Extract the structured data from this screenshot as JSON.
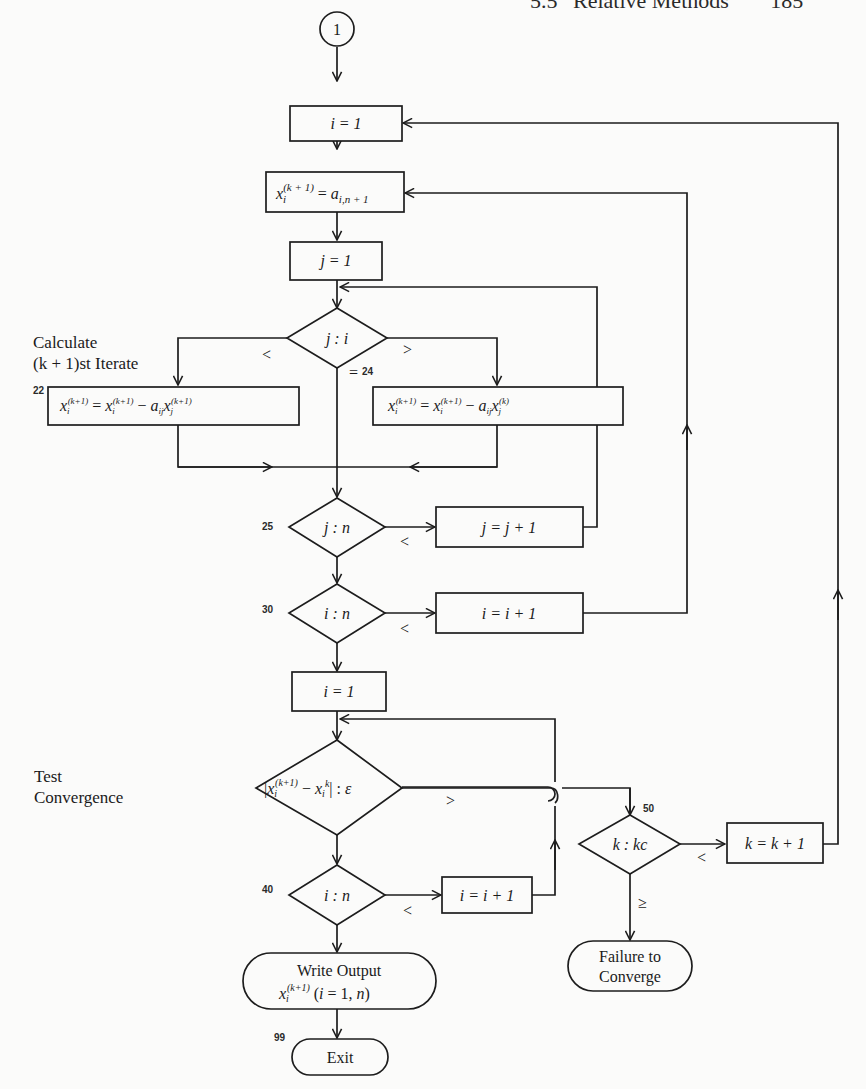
{
  "page_header": {
    "section": "5.5",
    "title": "Relative Methods",
    "page_number": "185"
  },
  "annotations": {
    "calculate_line1": "Calculate",
    "calculate_line2": "(k + 1)st Iterate",
    "test_line1": "Test",
    "test_line2": "Convergence"
  },
  "connector": {
    "label": "1"
  },
  "nodes": {
    "init_i": {
      "text": "i = 1"
    },
    "init_x": {
      "lhs": "x",
      "sub": "i",
      "sup": "(k + 1)",
      "eq": " = ",
      "rhs": "a",
      "rhs_sub": "i,n + 1"
    },
    "init_j": {
      "text": "j = 1"
    },
    "cmp_ji": {
      "text": "j : i"
    },
    "calc_lt": {
      "label": "22",
      "text": "x_i^(k+1) = x_i^(k+1) − a_ij x_j^(k+1)"
    },
    "calc_gt": {
      "label": "24",
      "text": "x_i^(k+1) = x_i^(k+1) − a_ij x_j^(k)"
    },
    "cmp_jn": {
      "label": "25",
      "text": "j : n"
    },
    "inc_j": {
      "text": "j = j + 1"
    },
    "cmp_in": {
      "label": "30",
      "text": "i : n"
    },
    "inc_i": {
      "text": "i = i + 1"
    },
    "reset_i": {
      "text": "i = 1"
    },
    "test_conv": {
      "text": "|x_i^(k+1) − x_i^k| : ε"
    },
    "cmp_in2": {
      "label": "40",
      "text": "i : n"
    },
    "inc_i2": {
      "text": "i = i + 1"
    },
    "cmp_kkc": {
      "label": "50",
      "text": "k : kc"
    },
    "inc_k": {
      "text": "k = k + 1"
    },
    "write_output": {
      "line1": "Write Output",
      "line2": "x_i^(k+1) (i = 1, n)"
    },
    "failure": {
      "line1": "Failure to",
      "line2": "Converge"
    },
    "exit": {
      "label": "99",
      "text": "Exit"
    }
  },
  "edge_labels": {
    "ji_lt": "<",
    "ji_eq": "=",
    "ji_gt": ">",
    "jn_lt": "<",
    "in_lt": "<",
    "conv_gt": ">",
    "in2_lt": "<",
    "kkc_lt": "<",
    "kkc_ge": "≥"
  }
}
